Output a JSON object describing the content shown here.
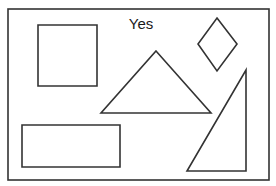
{
  "diagram": {
    "title": "Yes",
    "colors": {
      "stroke": "#333333",
      "background": "#ffffff",
      "text": "#1a1a1a"
    },
    "frame": {
      "x": 8,
      "y": 9,
      "width": 261,
      "height": 171
    },
    "shapes": [
      {
        "type": "square",
        "points": "38,25 97,25 97,86 38,86"
      },
      {
        "type": "diamond",
        "points": "217,18 237,44 217,71 198,44"
      },
      {
        "type": "triangle",
        "points": "156,51 211,113 101,113"
      },
      {
        "type": "right-triangle",
        "points": "246,70 246,171 187,171"
      },
      {
        "type": "rectangle",
        "points": "22,125 120,125 120,167 22,167"
      }
    ]
  }
}
